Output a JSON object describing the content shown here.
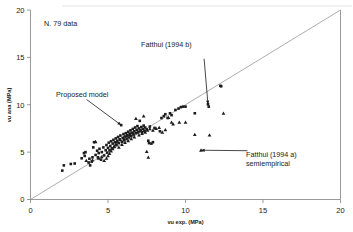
{
  "chart_data": {
    "type": "scatter",
    "title": "",
    "xlabel": "vu exp. (MPa)",
    "ylabel": "vu ana (MPa)",
    "xlim": [
      0,
      20
    ],
    "ylim": [
      0,
      20
    ],
    "xticks": [
      "0",
      "5",
      "10",
      "15",
      "20"
    ],
    "yticks": [
      "0",
      "5",
      "10",
      "15",
      "20"
    ],
    "xtick_values": [
      0,
      5,
      10,
      15,
      20
    ],
    "ytick_values": [
      0,
      5,
      10,
      15,
      20
    ],
    "grid": false,
    "legend_position": "none",
    "sample_note": "N. 79 data",
    "reference_line": {
      "name": "identity-line",
      "from": [
        0,
        0
      ],
      "to": [
        20,
        20
      ]
    },
    "annotations": [
      {
        "id": "proposed-model",
        "text": "Proposed model",
        "text_xy": [
          3.1,
          11.1
        ],
        "points_to": [
          5.85,
          7.85
        ]
      },
      {
        "id": "fatthui-1994-b",
        "text": "Fatthui (1994  b)",
        "text_xy": [
          8.0,
          15.6
        ],
        "points_to": [
          11.45,
          10.05
        ]
      },
      {
        "id": "fatthui-1994-a-semiempirical",
        "text_line1": "Fatthui (1994 a)",
        "text_line2": "semiempirical",
        "text_xy": [
          14.2,
          5.3
        ],
        "points_to": [
          11.0,
          5.2
        ]
      }
    ],
    "series": [
      {
        "name": "square-series",
        "marker": "square",
        "color": "#1c1c1c",
        "points": [
          [
            2.05,
            3.05
          ],
          [
            2.15,
            3.6
          ],
          [
            2.6,
            3.75
          ],
          [
            2.85,
            3.8
          ],
          [
            3.3,
            4.35
          ],
          [
            3.45,
            4.9
          ],
          [
            3.5,
            4.6
          ],
          [
            3.55,
            5.0
          ],
          [
            3.75,
            3.9
          ],
          [
            3.8,
            4.3
          ],
          [
            3.85,
            3.6
          ],
          [
            3.95,
            4.0
          ],
          [
            4.0,
            4.45
          ],
          [
            4.05,
            5.5
          ],
          [
            4.1,
            6.05
          ],
          [
            4.2,
            4.7
          ],
          [
            4.3,
            5.15
          ],
          [
            4.35,
            4.45
          ],
          [
            4.4,
            4.9
          ],
          [
            4.45,
            5.35
          ],
          [
            4.55,
            4.2
          ],
          [
            4.6,
            5.0
          ],
          [
            4.7,
            5.5
          ],
          [
            4.75,
            4.65
          ],
          [
            4.85,
            5.2
          ],
          [
            4.9,
            5.75
          ],
          [
            4.95,
            4.95
          ],
          [
            5.0,
            5.45
          ],
          [
            5.05,
            6.0
          ],
          [
            5.1,
            5.2
          ],
          [
            5.15,
            5.65
          ],
          [
            5.2,
            6.15
          ],
          [
            5.25,
            5.4
          ],
          [
            5.3,
            5.9
          ],
          [
            5.35,
            6.3
          ],
          [
            5.4,
            5.55
          ],
          [
            5.45,
            6.05
          ],
          [
            5.5,
            6.45
          ],
          [
            5.55,
            5.75
          ],
          [
            5.6,
            6.2
          ],
          [
            5.65,
            6.6
          ],
          [
            5.7,
            5.95
          ],
          [
            5.75,
            6.35
          ],
          [
            5.8,
            6.75
          ],
          [
            5.85,
            7.85
          ],
          [
            5.9,
            6.1
          ],
          [
            5.95,
            6.5
          ],
          [
            6.0,
            6.9
          ],
          [
            6.05,
            6.25
          ],
          [
            6.1,
            6.65
          ],
          [
            6.15,
            7.0
          ],
          [
            6.2,
            6.4
          ],
          [
            6.25,
            6.8
          ],
          [
            6.3,
            7.15
          ],
          [
            6.35,
            6.55
          ],
          [
            6.4,
            6.95
          ],
          [
            6.45,
            7.3
          ],
          [
            6.5,
            6.7
          ],
          [
            6.55,
            7.05
          ],
          [
            6.6,
            7.45
          ],
          [
            6.65,
            6.85
          ],
          [
            6.7,
            7.2
          ],
          [
            6.75,
            7.6
          ],
          [
            6.8,
            7.0
          ],
          [
            6.85,
            7.35
          ],
          [
            6.9,
            7.75
          ],
          [
            6.95,
            7.15
          ],
          [
            7.0,
            7.5
          ],
          [
            7.05,
            8.3
          ],
          [
            7.1,
            7.3
          ],
          [
            7.15,
            7.65
          ],
          [
            7.2,
            7.1
          ],
          [
            7.25,
            7.45
          ],
          [
            7.3,
            7.8
          ],
          [
            7.35,
            7.25
          ],
          [
            7.4,
            7.6
          ],
          [
            7.5,
            7.4
          ],
          [
            7.6,
            6.2
          ],
          [
            7.65,
            5.95
          ],
          [
            7.7,
            7.7
          ],
          [
            7.8,
            5.9
          ],
          [
            7.9,
            6.05
          ],
          [
            8.0,
            7.55
          ],
          [
            8.35,
            7.2
          ],
          [
            8.45,
            8.6
          ],
          [
            8.6,
            8.8
          ],
          [
            8.7,
            9.0
          ],
          [
            8.85,
            8.6
          ],
          [
            9.0,
            9.1
          ],
          [
            9.1,
            8.9
          ],
          [
            9.35,
            9.45
          ],
          [
            9.55,
            9.6
          ],
          [
            9.7,
            9.75
          ],
          [
            9.85,
            9.8
          ],
          [
            10.0,
            9.8
          ],
          [
            10.6,
            9.1
          ],
          [
            11.45,
            10.05
          ],
          [
            11.5,
            9.8
          ],
          [
            12.25,
            12.0
          ],
          [
            12.3,
            11.95
          ]
        ]
      },
      {
        "name": "triangle-series",
        "marker": "triangle",
        "color": "#1c1c1c",
        "points": [
          [
            3.6,
            4.1
          ],
          [
            4.0,
            4.15
          ],
          [
            4.2,
            6.1
          ],
          [
            4.4,
            4.35
          ],
          [
            4.6,
            4.5
          ],
          [
            4.75,
            4.1
          ],
          [
            4.9,
            4.35
          ],
          [
            5.0,
            4.6
          ],
          [
            5.1,
            4.85
          ],
          [
            5.2,
            5.1
          ],
          [
            5.3,
            5.35
          ],
          [
            5.4,
            5.6
          ],
          [
            5.5,
            5.85
          ],
          [
            5.6,
            6.05
          ],
          [
            5.7,
            5.5
          ],
          [
            5.8,
            6.3
          ],
          [
            5.9,
            5.8
          ],
          [
            6.0,
            6.5
          ],
          [
            6.1,
            6.0
          ],
          [
            6.2,
            6.7
          ],
          [
            6.3,
            6.2
          ],
          [
            6.4,
            6.85
          ],
          [
            6.5,
            6.4
          ],
          [
            6.6,
            7.0
          ],
          [
            6.7,
            6.6
          ],
          [
            6.8,
            8.55
          ],
          [
            6.9,
            7.1
          ],
          [
            7.0,
            6.8
          ],
          [
            7.1,
            7.25
          ],
          [
            7.2,
            6.95
          ],
          [
            7.3,
            8.8
          ],
          [
            7.4,
            7.1
          ],
          [
            7.5,
            5.05
          ],
          [
            7.55,
            7.3
          ],
          [
            7.6,
            4.45
          ],
          [
            7.7,
            7.45
          ],
          [
            7.9,
            7.3
          ],
          [
            8.1,
            7.5
          ],
          [
            8.3,
            7.6
          ],
          [
            8.5,
            7.1
          ],
          [
            8.7,
            7.35
          ],
          [
            8.9,
            8.65
          ],
          [
            9.1,
            8.15
          ],
          [
            9.2,
            7.95
          ],
          [
            9.6,
            8.15
          ],
          [
            10.0,
            8.15
          ],
          [
            10.6,
            6.85
          ],
          [
            11.0,
            5.2
          ],
          [
            11.55,
            6.8
          ],
          [
            12.45,
            9.1
          ]
        ]
      }
    ]
  }
}
